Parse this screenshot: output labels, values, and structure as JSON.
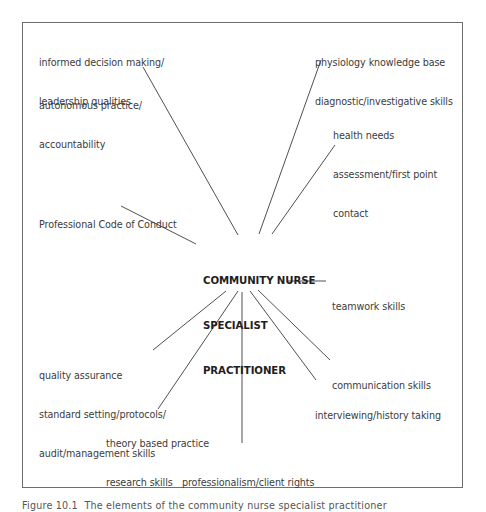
{
  "diagram": {
    "center": {
      "lines": [
        "COMMUNITY NURSE",
        "SPECIALIST",
        "PRACTITIONER"
      ]
    },
    "nodes": [
      {
        "id": "informed-decision",
        "lines": [
          "informed decision making/",
          "leadership qualities"
        ]
      },
      {
        "id": "autonomous-practice",
        "lines": [
          "autonomous practice/",
          "accountability"
        ]
      },
      {
        "id": "physiology-knowledge",
        "lines": [
          "physiology knowledge base",
          "diagnostic/investigative skills"
        ]
      },
      {
        "id": "health-needs",
        "lines": [
          "health needs",
          "assessment/first point",
          "contact"
        ]
      },
      {
        "id": "professional-code",
        "lines": [
          "Professional Code of Conduct"
        ]
      },
      {
        "id": "teamwork",
        "lines": [
          "teamwork skills"
        ]
      },
      {
        "id": "quality-assurance",
        "lines": [
          "quality assurance",
          "standard setting/protocols/",
          "audit/management skills"
        ]
      },
      {
        "id": "communication",
        "lines": [
          "communication skills"
        ]
      },
      {
        "id": "interviewing",
        "lines": [
          "interviewing/history taking"
        ]
      },
      {
        "id": "theory-based",
        "lines": [
          "theory based practice",
          "research skills"
        ]
      },
      {
        "id": "professionalism",
        "lines": [
          "professionalism/client rights"
        ]
      }
    ],
    "edges": [
      {
        "from": "center",
        "to": "autonomous-practice"
      },
      {
        "from": "center",
        "to": "physiology-knowledge"
      },
      {
        "from": "center",
        "to": "health-needs"
      },
      {
        "from": "center",
        "to": "professional-code"
      },
      {
        "from": "center",
        "to": "teamwork"
      },
      {
        "from": "center",
        "to": "quality-assurance"
      },
      {
        "from": "center",
        "to": "theory-based"
      },
      {
        "from": "center",
        "to": "professionalism"
      },
      {
        "from": "center",
        "to": "interviewing"
      },
      {
        "from": "center",
        "to": "communication"
      }
    ]
  },
  "caption": "Figure 10.1  The elements of the community nurse specialist practitioner"
}
